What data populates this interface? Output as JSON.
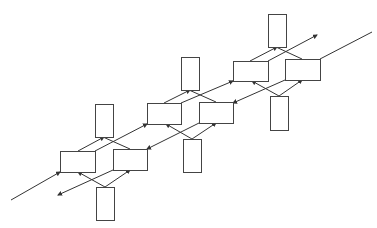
{
  "diagram": {
    "width": 377,
    "height": 228,
    "background": "#ffffff",
    "stroke_color": "#333333",
    "box_stroke_color": "#444444",
    "groups": [
      {
        "id": "group-1",
        "boxes": [
          {
            "id": "g1-top",
            "x": 95,
            "y": 104,
            "w": 18,
            "h": 33
          },
          {
            "id": "g1-left",
            "x": 60,
            "y": 151,
            "w": 35,
            "h": 21
          },
          {
            "id": "g1-right",
            "x": 113,
            "y": 149,
            "w": 34,
            "h": 21
          },
          {
            "id": "g1-bottom",
            "x": 96,
            "y": 187,
            "w": 18,
            "h": 33
          }
        ]
      },
      {
        "id": "group-2",
        "boxes": [
          {
            "id": "g2-top",
            "x": 181,
            "y": 57,
            "w": 18,
            "h": 33
          },
          {
            "id": "g2-left",
            "x": 147,
            "y": 103,
            "w": 34,
            "h": 21
          },
          {
            "id": "g2-right",
            "x": 199,
            "y": 102,
            "w": 34,
            "h": 21
          },
          {
            "id": "g2-bottom",
            "x": 183,
            "y": 139,
            "w": 18,
            "h": 33
          }
        ]
      },
      {
        "id": "group-3",
        "boxes": [
          {
            "id": "g3-top",
            "x": 268,
            "y": 14,
            "w": 18,
            "h": 33
          },
          {
            "id": "g3-left",
            "x": 233,
            "y": 61,
            "w": 35,
            "h": 20
          },
          {
            "id": "g3-right",
            "x": 285,
            "y": 59,
            "w": 35,
            "h": 21
          },
          {
            "id": "g3-bottom",
            "x": 270,
            "y": 96,
            "w": 18,
            "h": 34
          }
        ]
      }
    ],
    "edges": [
      {
        "x1": 11,
        "y1": 200,
        "x2": 60,
        "y2": 172,
        "arrow": true
      },
      {
        "x1": 78,
        "y1": 151,
        "x2": 104,
        "y2": 137,
        "arrow": true
      },
      {
        "x1": 130,
        "y1": 149,
        "x2": 103,
        "y2": 137,
        "arrow": false
      },
      {
        "x1": 95,
        "y1": 151,
        "x2": 147,
        "y2": 124,
        "arrow": true
      },
      {
        "x1": 105,
        "y1": 187,
        "x2": 78,
        "y2": 172,
        "arrow": true
      },
      {
        "x1": 105,
        "y1": 187,
        "x2": 130,
        "y2": 170,
        "arrow": true
      },
      {
        "x1": 113,
        "y1": 170,
        "x2": 58,
        "y2": 195,
        "arrow": true
      },
      {
        "x1": 199,
        "y1": 123,
        "x2": 147,
        "y2": 149,
        "arrow": true
      },
      {
        "x1": 164,
        "y1": 103,
        "x2": 190,
        "y2": 90,
        "arrow": true
      },
      {
        "x1": 216,
        "y1": 102,
        "x2": 189,
        "y2": 90,
        "arrow": false
      },
      {
        "x1": 181,
        "y1": 103,
        "x2": 233,
        "y2": 81,
        "arrow": true
      },
      {
        "x1": 192,
        "y1": 139,
        "x2": 166,
        "y2": 124,
        "arrow": true
      },
      {
        "x1": 192,
        "y1": 139,
        "x2": 216,
        "y2": 123,
        "arrow": true
      },
      {
        "x1": 285,
        "y1": 80,
        "x2": 233,
        "y2": 103,
        "arrow": true
      },
      {
        "x1": 250,
        "y1": 61,
        "x2": 277,
        "y2": 47,
        "arrow": true
      },
      {
        "x1": 302,
        "y1": 59,
        "x2": 276,
        "y2": 47,
        "arrow": false
      },
      {
        "x1": 268,
        "y1": 61,
        "x2": 317,
        "y2": 35,
        "arrow": true
      },
      {
        "x1": 279,
        "y1": 96,
        "x2": 252,
        "y2": 81,
        "arrow": true
      },
      {
        "x1": 279,
        "y1": 96,
        "x2": 302,
        "y2": 80,
        "arrow": true
      },
      {
        "x1": 320,
        "y1": 59,
        "x2": 372,
        "y2": 32,
        "arrow": false
      }
    ]
  }
}
